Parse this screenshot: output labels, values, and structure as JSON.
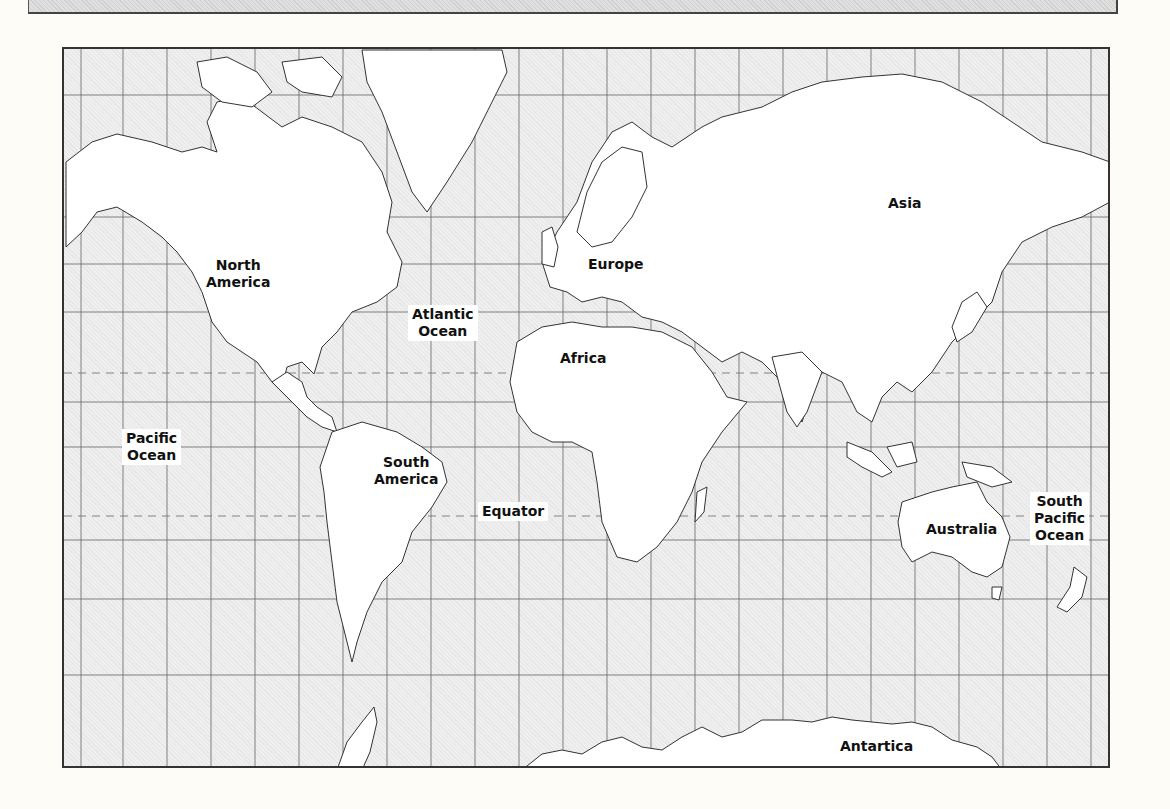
{
  "map": {
    "projection": "Mercator world outline map",
    "frame": {
      "x": 62,
      "y": 47,
      "width": 1048,
      "height": 721
    },
    "colors": {
      "background": "#fdfcf7",
      "ocean_fill": "#ececec",
      "land_fill": "#ffffff",
      "outline": "#333333",
      "grid": "#555555"
    },
    "grid": {
      "vertical_x": [
        79,
        121,
        165,
        209,
        253,
        297,
        341,
        385,
        429,
        473,
        517,
        561,
        605,
        649,
        693,
        737,
        781,
        825,
        869,
        913,
        957,
        1001,
        1045,
        1089
      ],
      "horizontal_y": [
        93,
        215,
        262,
        310,
        400,
        445,
        538,
        597,
        673
      ]
    },
    "dashed_lines": [
      {
        "name": "tropic-of-cancer",
        "y": 371
      },
      {
        "name": "equator-line",
        "y": 514
      }
    ],
    "labels": {
      "north_america": [
        "North",
        "America"
      ],
      "atlantic_ocean": [
        "Atlantic",
        "Ocean"
      ],
      "europe": [
        "Europe"
      ],
      "asia": [
        "Asia"
      ],
      "africa": [
        "Africa"
      ],
      "pacific_ocean": [
        "Pacific",
        "Ocean"
      ],
      "south_america": [
        "South",
        "America"
      ],
      "equator": [
        "Equator"
      ],
      "australia": [
        "Australia"
      ],
      "south_pacific_ocean": [
        "South",
        "Pacific",
        "Ocean"
      ],
      "antarctica": [
        "Antartica"
      ]
    }
  }
}
